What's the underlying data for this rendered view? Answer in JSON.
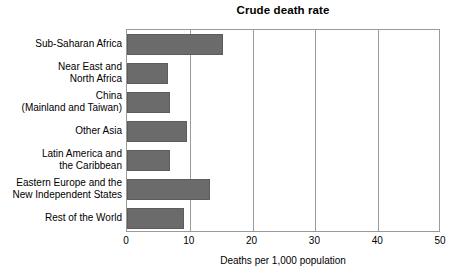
{
  "chart_data": {
    "type": "bar",
    "orientation": "horizontal",
    "title": "Crude death rate",
    "xlabel": "Deaths per 1,000 population",
    "ylabel": "",
    "xlim": [
      0,
      50
    ],
    "xticks": [
      "0",
      "10",
      "20",
      "30",
      "40",
      "50"
    ],
    "xtick_values": [
      0,
      10,
      20,
      30,
      40,
      50
    ],
    "grid": "vertical",
    "legend": "none",
    "bar_color": "#6b6b6b",
    "categories": [
      "Sub-Saharan Africa",
      "Near East and\nNorth Africa",
      "China\n(Mainland and Taiwan)",
      "Other Asia",
      "Latin America and\nthe Caribbean",
      "Eastern Europe and the\nNew Independent States",
      "Rest of the World"
    ],
    "values": [
      15.3,
      6.5,
      6.8,
      9.5,
      6.9,
      13.2,
      9.1
    ]
  }
}
